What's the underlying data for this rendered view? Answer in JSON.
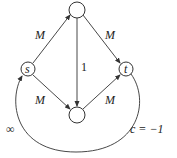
{
  "diagram": {
    "type": "flow-network",
    "nodes": [
      {
        "id": "s",
        "label": "s",
        "x": 28,
        "y": 69
      },
      {
        "id": "top",
        "label": "",
        "x": 77,
        "y": 10
      },
      {
        "id": "bottom",
        "label": "",
        "x": 77,
        "y": 115
      },
      {
        "id": "t",
        "label": "t",
        "x": 126,
        "y": 69
      }
    ],
    "edges": [
      {
        "from": "s",
        "to": "top",
        "label": "M"
      },
      {
        "from": "top",
        "to": "t",
        "label": "M"
      },
      {
        "from": "s",
        "to": "bottom",
        "label": "M"
      },
      {
        "from": "bottom",
        "to": "t",
        "label": "M"
      },
      {
        "from": "top",
        "to": "bottom",
        "label": "1"
      },
      {
        "from": "t",
        "to": "s",
        "label_left": "∞",
        "label_right": "c = −1"
      }
    ]
  },
  "labels": {
    "s": "s",
    "t": "t",
    "s_top": "M",
    "top_t": "M",
    "s_bottom": "M",
    "bottom_t": "M",
    "top_bottom": "1",
    "return_cap": "∞",
    "return_cost": "c = −1"
  }
}
